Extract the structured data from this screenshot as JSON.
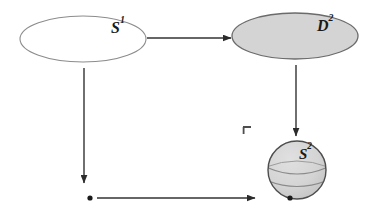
{
  "diagram": {
    "background_color": "#ffffff",
    "nodes": [
      {
        "id": "s1",
        "label_base": "S",
        "label_sup": "1",
        "shape": "ellipse",
        "fill": "#ffffff",
        "stroke": "#8c8c8c",
        "cx": 83,
        "cy": 39,
        "rx": 63,
        "ry": 23
      },
      {
        "id": "d2",
        "label_base": "D",
        "label_sup": "2",
        "shape": "ellipse",
        "fill": "#d4d4d4",
        "stroke": "#6b6b6b",
        "cx": 295,
        "cy": 36,
        "rx": 63,
        "ry": 23
      },
      {
        "id": "s2",
        "label_base": "S",
        "label_sup": "2",
        "shape": "sphere",
        "fill": "#d4d4d4",
        "stroke": "#4d4d4d",
        "cx": 297,
        "cy": 170,
        "r": 29
      }
    ],
    "points": [
      {
        "id": "basepoint-left",
        "cx": 90,
        "cy": 198,
        "r": 2.6,
        "color": "#1a1a1a"
      },
      {
        "id": "basepoint-sphere",
        "cx": 290,
        "cy": 198,
        "r": 2.6,
        "color": "#1a1a1a"
      }
    ],
    "arrows": [
      {
        "id": "s1-to-d2",
        "from": "s1",
        "to": "d2",
        "orientation": "horizontal",
        "x1": 147,
        "y1": 38,
        "x2": 231,
        "y2": 38,
        "color": "#333333"
      },
      {
        "id": "s1-to-basepoint",
        "from": "s1",
        "to": "basepoint-left",
        "orientation": "vertical",
        "x1": 84,
        "y1": 68,
        "x2": 84,
        "y2": 183,
        "color": "#333333"
      },
      {
        "id": "d2-to-s2",
        "from": "d2",
        "to": "s2",
        "orientation": "vertical",
        "x1": 296,
        "y1": 65,
        "x2": 296,
        "y2": 136,
        "color": "#333333"
      },
      {
        "id": "basepoint-to-s2",
        "from": "basepoint-left",
        "to": "basepoint-sphere",
        "orientation": "horizontal",
        "x1": 97,
        "y1": 198,
        "x2": 255,
        "y2": 198,
        "color": "#333333"
      }
    ],
    "marks": [
      {
        "id": "corner-bracket",
        "glyph": "corner-bracket",
        "x": 243,
        "y": 127,
        "color": "#4d4d4d"
      }
    ]
  }
}
